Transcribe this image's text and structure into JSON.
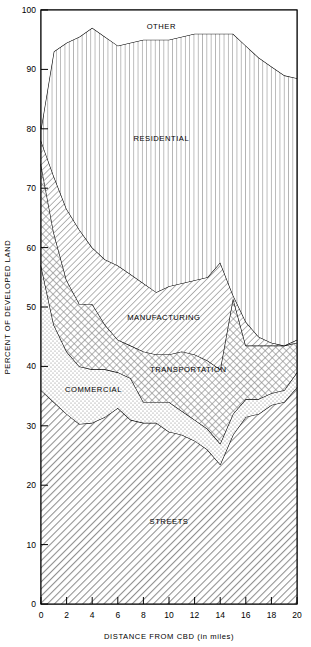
{
  "chart_data": {
    "type": "area",
    "subtype": "stacked-area",
    "title": "",
    "xlabel": "DISTANCE FROM CBD (in miles)",
    "ylabel": "PERCENT OF DEVELOPED LAND",
    "xlim": [
      0,
      20
    ],
    "ylim": [
      0,
      100
    ],
    "grid": false,
    "legend": "inline-area-labels",
    "xticks": [
      0,
      2,
      4,
      6,
      8,
      10,
      12,
      14,
      16,
      18,
      20
    ],
    "xticklabels": [
      "0",
      "2",
      "4",
      "6",
      "8",
      "10",
      "12",
      "14",
      "16",
      "18",
      "20"
    ],
    "yticks": [
      0,
      10,
      20,
      30,
      40,
      50,
      60,
      70,
      80,
      90,
      100
    ],
    "yticklabels": [
      "0",
      "10",
      "20",
      "30",
      "40",
      "50",
      "60",
      "70",
      "80",
      "90",
      "100"
    ],
    "x": [
      0,
      1,
      2,
      3,
      4,
      5,
      6,
      7,
      8,
      9,
      10,
      11,
      12,
      13,
      14,
      15,
      16,
      17,
      18,
      19,
      20
    ],
    "series": [
      {
        "name": "STREETS",
        "fill": "diagonal-hatch",
        "label_x": 10,
        "label_y": 14,
        "cumulative": [
          36,
          34,
          32,
          30.3,
          30.5,
          31.5,
          33,
          31,
          30.5,
          30.5,
          29,
          28.5,
          27.5,
          26,
          23.5,
          28.5,
          31.5,
          32,
          33.5,
          34,
          36.5
        ],
        "values": [
          36,
          34,
          32,
          30.3,
          30.5,
          31.5,
          33,
          31,
          30.5,
          30.5,
          29,
          28.5,
          27.5,
          26,
          23.5,
          28.5,
          31.5,
          32,
          33.5,
          34,
          36.5
        ]
      },
      {
        "name": "COMMERCIAL",
        "fill": "stipple-dots",
        "label_x": 4.1,
        "label_y": 36.2,
        "cumulative": [
          57,
          47,
          42.5,
          40,
          39.5,
          39.5,
          39,
          38,
          34,
          34,
          34,
          32.5,
          31,
          29.5,
          27,
          32,
          34.5,
          34.5,
          35.5,
          36,
          39
        ],
        "values": [
          21,
          13,
          10.5,
          9.7,
          9,
          8,
          6,
          7,
          3.5,
          3.5,
          5,
          4,
          3.5,
          3.5,
          3.5,
          3.5,
          3,
          2.5,
          2,
          2,
          2.5
        ]
      },
      {
        "name": "TRANSPORTATION",
        "fill": "cross-hatch",
        "label_x": 11.5,
        "label_y": 39.6,
        "cumulative": [
          74,
          62.5,
          54.5,
          50.5,
          50.5,
          47,
          44.5,
          43.5,
          42.5,
          42,
          42,
          42.5,
          42,
          41,
          39.5,
          51.5,
          43.5,
          43.5,
          43.5,
          43.5,
          44
        ],
        "values": [
          17,
          15.5,
          12,
          10.5,
          11,
          7.5,
          5.5,
          5.5,
          8.5,
          8,
          8,
          10,
          11,
          11.5,
          12.5,
          19.5,
          9,
          9,
          8,
          7.5,
          5
        ]
      },
      {
        "name": "MANUFACTURING",
        "fill": "diagonal-hatch-fine",
        "label_x": 9.6,
        "label_y": 48.3,
        "cumulative": [
          78,
          72,
          66.5,
          63,
          60,
          58,
          57,
          55.5,
          54,
          52.5,
          53.5,
          54,
          54.5,
          55,
          57.5,
          52,
          47.5,
          45,
          44,
          43.5,
          44.5
        ],
        "values": [
          4,
          9.5,
          12,
          12.5,
          9.5,
          11,
          12.5,
          12,
          11.5,
          10.5,
          11.5,
          11.5,
          12.5,
          14,
          18,
          0.5,
          4,
          1.5,
          0.5,
          0,
          0.5
        ]
      },
      {
        "name": "RESIDENTIAL",
        "fill": "vertical-lines",
        "label_x": 9.4,
        "label_y": 78.5,
        "cumulative": [
          80,
          93,
          94.5,
          95.5,
          97,
          95.5,
          94,
          94.5,
          95,
          95,
          95,
          95.5,
          96,
          96,
          96,
          96,
          94,
          92,
          90.5,
          89,
          88.5
        ],
        "values": [
          2,
          21,
          28,
          32.5,
          37,
          37.5,
          37,
          39,
          41,
          42.5,
          41.5,
          41.5,
          41.5,
          41,
          38.5,
          44,
          46.5,
          47,
          46.5,
          45.5,
          44
        ]
      },
      {
        "name": "OTHER",
        "fill": "none",
        "label_x": 9.4,
        "label_y": 97.3,
        "cumulative": [
          100,
          100,
          100,
          100,
          100,
          100,
          100,
          100,
          100,
          100,
          100,
          100,
          100,
          100,
          100,
          100,
          100,
          100,
          100,
          100,
          100
        ],
        "values": [
          20,
          7,
          5.5,
          4.5,
          3,
          4.5,
          6,
          5.5,
          5,
          5,
          5,
          4.5,
          4,
          4,
          4,
          4,
          6,
          8,
          9.5,
          11,
          11.5
        ]
      }
    ]
  },
  "colors": {
    "line": "#000000",
    "background": "#ffffff",
    "streets_tone": "#b9b9b9",
    "commercial_tone": "#efefef",
    "transportation_tone": "#cfcfcf",
    "manufacturing_tone": "#e2e2e2"
  }
}
